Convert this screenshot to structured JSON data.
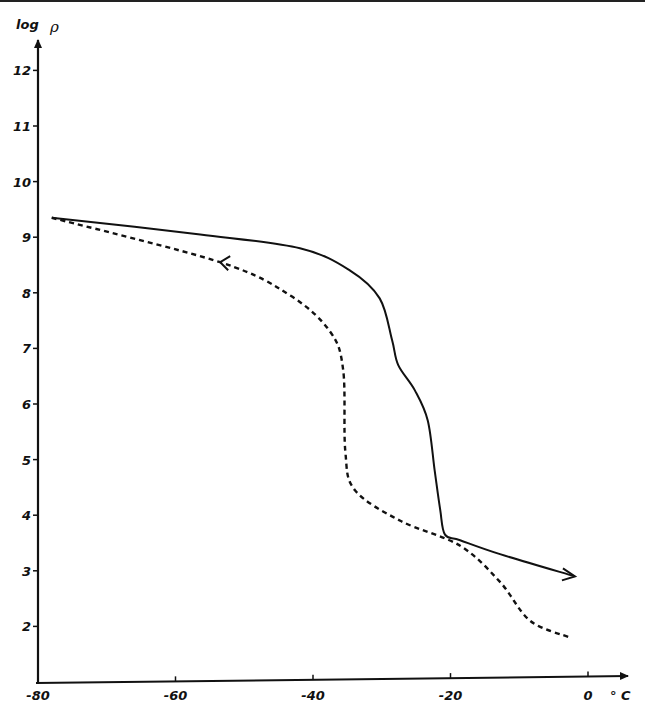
{
  "chart_data": {
    "type": "line",
    "title": "",
    "xlabel": "°C",
    "ylabel": "log ρ",
    "xlim": [
      -80,
      0
    ],
    "ylim": [
      1,
      12.5
    ],
    "grid": false,
    "legend": null,
    "x_ticks": [
      -80,
      -60,
      -40,
      -20,
      0
    ],
    "x_tick_labels": [
      "-80",
      "-60",
      "-40",
      "-20",
      "0"
    ],
    "y_ticks": [
      2,
      3,
      4,
      5,
      6,
      7,
      8,
      9,
      10,
      11,
      12
    ],
    "y_tick_labels": [
      "2",
      "3",
      "4",
      "5",
      "6",
      "7",
      "8",
      "9",
      "10",
      "11",
      "12"
    ],
    "series": [
      {
        "name": "heating (solid, arrow to the right)",
        "style": "solid",
        "direction": "increasing temperature",
        "x": [
          -78,
          -56.4,
          -41.9,
          -34.6,
          -30.3,
          -28.5,
          -27.6,
          -25.2,
          -23.3,
          -22.3,
          -21.5,
          -20.8,
          -18.6,
          -12.8,
          -1.9
        ],
        "y": [
          9.35,
          9.05,
          8.8,
          8.4,
          7.9,
          7.15,
          6.7,
          6.25,
          5.7,
          4.8,
          4.1,
          3.65,
          3.55,
          3.3,
          2.9
        ]
      },
      {
        "name": "cooling (dashed, arrow to the left)",
        "style": "dashed",
        "direction": "decreasing temperature",
        "x": [
          -78,
          -53.5,
          -43.3,
          -37.5,
          -35.6,
          -35.3,
          -33.9,
          -27.3,
          -18.6,
          -12.8,
          -8.4,
          -2.6
        ],
        "y": [
          9.35,
          8.55,
          7.95,
          7.3,
          6.6,
          5.15,
          4.45,
          3.9,
          3.45,
          2.8,
          2.1,
          1.8
        ]
      }
    ]
  },
  "axes": {
    "y_title_prefix": "log",
    "y_title_symbol": "ρ",
    "x_unit": "° C"
  }
}
